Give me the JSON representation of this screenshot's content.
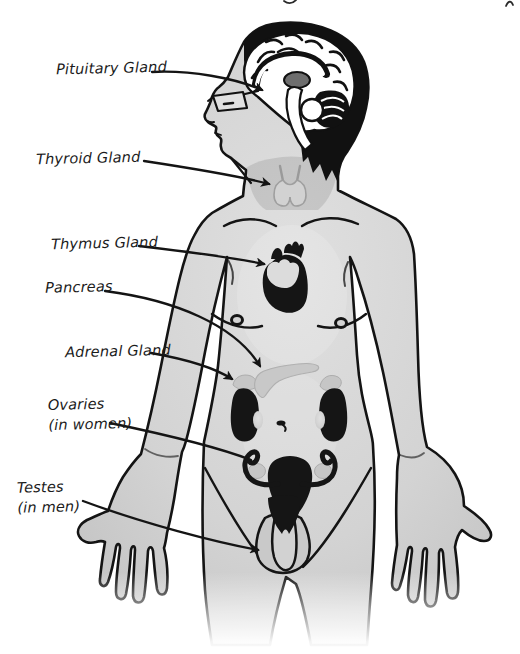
{
  "diagram": {
    "type": "anatomical-diagram"
  },
  "labels": {
    "pituitary": {
      "text": "Pituitary Gland"
    },
    "thyroid": {
      "text": "Thyroid Gland"
    },
    "thymus": {
      "text": "Thymus Gland"
    },
    "pancreas": {
      "text": "Pancreas"
    },
    "adrenal": {
      "text": "Adrenal Gland"
    },
    "ovaries": {
      "text": "Ovaries",
      "note": "(in women)"
    },
    "testes": {
      "text": "Testes",
      "note": "(in men)"
    }
  },
  "colors": {
    "background": "#ffffff",
    "outline": "#141414",
    "skin": "#d3d3d3",
    "skin_shadow": "#bdbdbd",
    "organ_black": "#151515",
    "gland_gray": "#c6c6c6",
    "brain_white": "#ffffff"
  }
}
